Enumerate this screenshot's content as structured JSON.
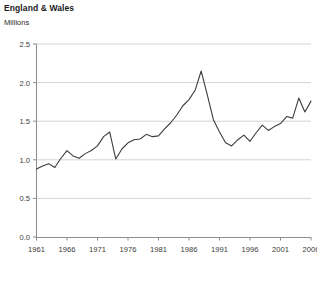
{
  "header": {
    "title": "England & Wales",
    "subtitle": "Millions"
  },
  "footnote": "",
  "colors": {
    "line": "#3c3c3c",
    "grid": "#d4d4d4",
    "axis": "#8c8c8c",
    "text": "#231f20"
  },
  "chart_data": {
    "type": "line",
    "title": "England & Wales",
    "subtitle": "Millions",
    "xlabel": "",
    "ylabel": "Millions",
    "xlim": [
      1961,
      2006
    ],
    "ylim": [
      0.0,
      2.5
    ],
    "yticks": [
      "0.0",
      "0.5",
      "1.0",
      "1.5",
      "2.0",
      "2.5"
    ],
    "ytick_values": [
      0.0,
      0.5,
      1.0,
      1.5,
      2.0,
      2.5
    ],
    "xticks": [
      "1961",
      "1966",
      "1971",
      "1976",
      "1981",
      "1986",
      "1991",
      "1996",
      "2001",
      "2006"
    ],
    "xtick_values": [
      1961,
      1966,
      1971,
      1976,
      1981,
      1986,
      1991,
      1996,
      2001,
      2006
    ],
    "grid": "horizontal",
    "legend": "none",
    "series": [
      {
        "name": "England & Wales",
        "x": [
          1961,
          1962,
          1963,
          1964,
          1965,
          1966,
          1967,
          1968,
          1969,
          1970,
          1971,
          1972,
          1973,
          1974,
          1975,
          1976,
          1977,
          1978,
          1979,
          1980,
          1981,
          1982,
          1983,
          1984,
          1985,
          1986,
          1987,
          1988,
          1989,
          1990,
          1991,
          1992,
          1993,
          1994,
          1995,
          1996,
          1997,
          1998,
          1999,
          2000,
          2001,
          2002,
          2003,
          2004,
          2005,
          2006
        ],
        "values": [
          0.88,
          0.92,
          0.95,
          0.9,
          1.02,
          1.12,
          1.05,
          1.02,
          1.08,
          1.12,
          1.18,
          1.3,
          1.36,
          1.01,
          1.14,
          1.22,
          1.26,
          1.27,
          1.33,
          1.3,
          1.31,
          1.4,
          1.48,
          1.58,
          1.7,
          1.78,
          1.9,
          2.15,
          1.84,
          1.52,
          1.36,
          1.22,
          1.18,
          1.26,
          1.32,
          1.24,
          1.35,
          1.45,
          1.38,
          1.43,
          1.47,
          1.56,
          1.54,
          1.8,
          1.62,
          1.76
        ]
      }
    ]
  }
}
